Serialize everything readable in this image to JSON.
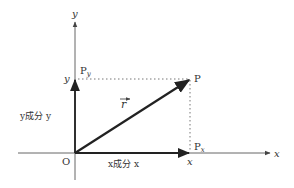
{
  "diagram": {
    "colors": {
      "axis": "#555555",
      "vector": "#222222",
      "dotted": "#777777",
      "text": "#333333"
    },
    "labels": {
      "y_axis": "y",
      "x_axis": "x",
      "origin": "O",
      "point": "P",
      "py": "P",
      "py_sub": "y",
      "px": "P",
      "px_sub": "x",
      "y_tick": "y",
      "x_tick": "x",
      "vector": "r",
      "y_component": "y成分 y",
      "x_component": "x成分 x"
    }
  }
}
